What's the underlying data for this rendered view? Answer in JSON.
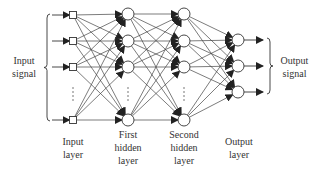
{
  "diagram": {
    "type": "feedforward-neural-network",
    "colors": {
      "stroke": "#333333",
      "node_fill": "#ffffff",
      "background": "#ffffff"
    },
    "layers": [
      {
        "name": "input",
        "label_lines": [
          "Input",
          "layer"
        ],
        "node_shape": "square",
        "x": 73,
        "node_y": [
          15,
          41,
          67,
          120
        ],
        "ellipsis": true
      },
      {
        "name": "hidden1",
        "label_lines": [
          "First",
          "hidden",
          "layer"
        ],
        "node_shape": "circle",
        "x": 128,
        "node_y": [
          14,
          41,
          67,
          120
        ],
        "ellipsis": true
      },
      {
        "name": "hidden2",
        "label_lines": [
          "Second",
          "hidden",
          "layer"
        ],
        "node_shape": "circle",
        "x": 184,
        "node_y": [
          14,
          41,
          67,
          120
        ],
        "ellipsis": true
      },
      {
        "name": "output",
        "label_lines": [
          "Output",
          "layer"
        ],
        "node_shape": "circle",
        "x": 238,
        "node_y": [
          40,
          66,
          92
        ],
        "ellipsis": false
      }
    ],
    "input_signal": {
      "label_lines": [
        "Input",
        "signal"
      ]
    },
    "output_signal": {
      "label_lines": [
        "Output",
        "signal"
      ]
    }
  }
}
